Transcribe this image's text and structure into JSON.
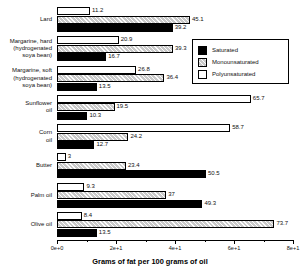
{
  "chart_data": {
    "type": "bar",
    "orientation": "horizontal",
    "title": "",
    "xlabel": "Grams of fat per 100 grams of oil",
    "ylabel": "",
    "xlim": [
      0,
      80
    ],
    "grid": false,
    "legend_position": "top-right",
    "categories": [
      "Lard",
      "Margarine, hard\n(hydrogenated\nsoya bean)",
      "Margarine, soft\n(hydrogenated\nsoya bean)",
      "Sunflower\noil",
      "Corn\noil",
      "Butter",
      "Palm oil",
      "Olive oil"
    ],
    "series": [
      {
        "name": "Saturated",
        "color": "#000000",
        "values": [
          39.2,
          16.7,
          13.5,
          10.3,
          12.7,
          50.5,
          49.3,
          13.5
        ]
      },
      {
        "name": "Monounsaturated",
        "color": "#c9c9c9",
        "values": [
          45.1,
          39.3,
          36.4,
          19.5,
          24.2,
          23.4,
          37,
          73.7
        ]
      },
      {
        "name": "Polyunsaturated",
        "color": "#ffffff",
        "values": [
          11.2,
          20.9,
          26.8,
          65.7,
          58.7,
          3,
          9.3,
          8.4
        ]
      }
    ],
    "value_labels": [
      [
        "39.2",
        "16.7",
        "13.5",
        "10.3",
        "12.7",
        "50.5",
        "49.3",
        "13.5"
      ],
      [
        "45.1",
        "39.3",
        "36.4",
        "19.5",
        "24.2",
        "23.4",
        "37",
        "73.7"
      ],
      [
        "11.2",
        "20.9",
        "26.8",
        "65.7",
        "58.7",
        "3",
        "9.3",
        "8.4"
      ]
    ],
    "xticks": [
      0,
      20,
      40,
      60,
      80
    ],
    "xtick_labels": [
      "0e+0",
      "2e+1",
      "4e+1",
      "6e+1",
      "8e+1"
    ]
  },
  "legend": {
    "items": [
      {
        "label": "Saturated",
        "swatch": "solid-black"
      },
      {
        "label": "Monounsaturated",
        "swatch": "hatched-gray"
      },
      {
        "label": "Polyunsaturated",
        "swatch": "open-white"
      }
    ]
  }
}
